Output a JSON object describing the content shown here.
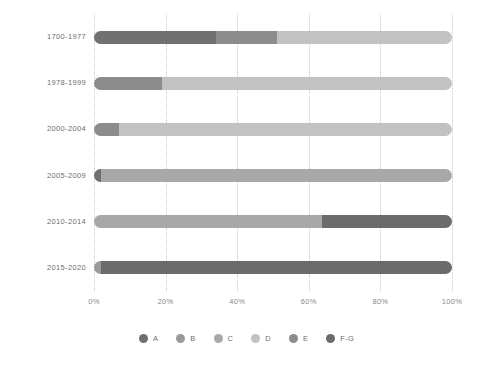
{
  "chart_data": {
    "type": "bar",
    "orientation": "horizontal",
    "stacked": true,
    "normalized_percent": true,
    "title": "",
    "subtitle": "",
    "xlabel": "",
    "ylabel": "",
    "xlim": [
      0,
      100
    ],
    "xticks": [
      0,
      20,
      40,
      60,
      80,
      100
    ],
    "xtick_labels": [
      "0%",
      "20%",
      "40%",
      "60%",
      "80%",
      "100%"
    ],
    "grid": "vertical-dotted",
    "legend_position": "bottom-center",
    "categories": [
      "1700-1977",
      "1978-1999",
      "2000-2004",
      "2005-2009",
      "2010-2014",
      "2015-2020"
    ],
    "series": [
      {
        "name": "A",
        "color": "#6f6f6f",
        "values": [
          0.0,
          0.0,
          0.0,
          2.0,
          0.0,
          0.0
        ]
      },
      {
        "name": "B",
        "color": "#9a9a9a",
        "values": [
          0.0,
          0.0,
          0.0,
          0.0,
          0.0,
          2.0
        ]
      },
      {
        "name": "C",
        "color": "#a8a8a8",
        "values": [
          0.0,
          0.0,
          0.0,
          98.0,
          63.7,
          0.0
        ]
      },
      {
        "name": "D",
        "color": "#c2c2c2",
        "values": [
          49.0,
          81.0,
          93.0,
          0.0,
          0.0,
          0.0
        ]
      },
      {
        "name": "E",
        "color": "#8c8c8c",
        "values": [
          17.0,
          19.0,
          7.0,
          0.0,
          0.0,
          0.0
        ]
      },
      {
        "name": "F-G",
        "color": "#707070",
        "values": [
          34.0,
          0.0,
          0.0,
          0.0,
          36.3,
          98.0
        ]
      }
    ],
    "bars": [
      {
        "category": "1700-1977",
        "segments": [
          {
            "series": "F-G",
            "value": 34.0,
            "color": "#707070"
          },
          {
            "series": "E",
            "value": 17.0,
            "color": "#8c8c8c"
          },
          {
            "series": "D",
            "value": 49.0,
            "color": "#c2c2c2"
          }
        ]
      },
      {
        "category": "1978-1999",
        "segments": [
          {
            "series": "E",
            "value": 19.0,
            "color": "#8c8c8c"
          },
          {
            "series": "D",
            "value": 81.0,
            "color": "#c2c2c2"
          }
        ]
      },
      {
        "category": "2000-2004",
        "segments": [
          {
            "series": "E",
            "value": 7.0,
            "color": "#8c8c8c"
          },
          {
            "series": "D",
            "value": 93.0,
            "color": "#c2c2c2"
          }
        ]
      },
      {
        "category": "2005-2009",
        "segments": [
          {
            "series": "A",
            "value": 2.0,
            "color": "#6f6f6f"
          },
          {
            "series": "C",
            "value": 98.0,
            "color": "#a8a8a8"
          }
        ]
      },
      {
        "category": "2010-2014",
        "segments": [
          {
            "series": "C",
            "value": 63.7,
            "color": "#a8a8a8"
          },
          {
            "series": "F-G",
            "value": 36.3,
            "color": "#6b6b6b"
          }
        ]
      },
      {
        "category": "2015-2020",
        "segments": [
          {
            "series": "B",
            "value": 2.0,
            "color": "#9a9a9a"
          },
          {
            "series": "F-G",
            "value": 98.0,
            "color": "#6b6b6b"
          }
        ]
      }
    ],
    "legend": [
      {
        "label": "A",
        "color": "#6f6f6f"
      },
      {
        "label": "B",
        "color": "#9a9a9a"
      },
      {
        "label": "C",
        "color": "#a8a8a8"
      },
      {
        "label": "D",
        "color": "#c2c2c2"
      },
      {
        "label": "E",
        "color": "#8c8c8c"
      },
      {
        "label": "F-G",
        "color": "#6b6b6b"
      }
    ]
  }
}
